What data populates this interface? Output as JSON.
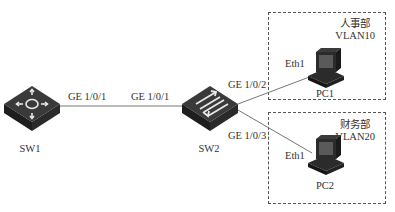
{
  "diagram": {
    "type": "network-topology",
    "nodes": {
      "sw1": {
        "label": "SW1",
        "kind": "switch",
        "icon": "layer3-switch-icon"
      },
      "sw2": {
        "label": "SW2",
        "kind": "switch",
        "icon": "layer2-switch-icon"
      },
      "pc1": {
        "label": "PC1",
        "kind": "pc",
        "icon": "pc-icon",
        "port": "Eth1"
      },
      "pc2": {
        "label": "PC2",
        "kind": "pc",
        "icon": "pc-icon",
        "port": "Eth1"
      }
    },
    "links": [
      {
        "from": "SW1",
        "from_port": "GE 1/0/1",
        "to": "SW2",
        "to_port": "GE 1/0/1"
      },
      {
        "from": "SW2",
        "from_port": "GE 1/0/2",
        "to": "PC1",
        "to_port": "Eth1"
      },
      {
        "from": "SW2",
        "from_port": "GE 1/0/3",
        "to": "PC2",
        "to_port": "Eth1"
      }
    ],
    "groups": [
      {
        "department": "人事部",
        "vlan": "VLAN10",
        "members": [
          "PC1"
        ]
      },
      {
        "department": "财务部",
        "vlan": "VLAN20",
        "members": [
          "PC2"
        ]
      }
    ],
    "colors": {
      "line": "#777777",
      "device": "#2b2b2b",
      "border": "#555555"
    }
  }
}
